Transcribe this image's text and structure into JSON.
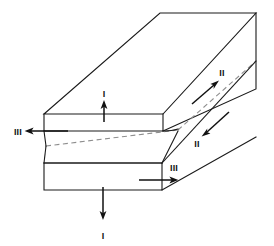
{
  "figure": {
    "name": "fracture-modes-diagram",
    "background_color": "#ffffff",
    "edge_color": "#1a1a1a",
    "crack_line_color": "#8e8e8e",
    "arrow_color": "#111111"
  },
  "labels": {
    "mode_i_top": "I",
    "mode_i_bottom": "I",
    "mode_ii_upper": "II",
    "mode_ii_lower": "II",
    "mode_iii_left": "III",
    "mode_iii_right": "III"
  },
  "geometry": {
    "upper_block": {
      "front_face": "44,114 163,114 163,131 44,131",
      "top_face": "44,114 160,13 256,13 163,114",
      "right_face": "163,114 256,13 256,89 163,131"
    },
    "lower_block": {
      "front_face": "44,163 162,163 162,190 44,190",
      "top_face": "44,163 160,62 256,62 162,163",
      "right_face": "162,163 256,62 256,138 162,190"
    },
    "crack_front_dash": "46,146 178,130",
    "crack_flank_left": "44,131 46,146",
    "crack_flank_lower": "46,146 44,163"
  },
  "arrows": {
    "mode_i_top": {
      "from": [
        104,
        122
      ],
      "to": [
        104,
        101
      ],
      "direction": "up"
    },
    "mode_i_bottom": {
      "from": [
        103,
        187
      ],
      "to": [
        103,
        219
      ],
      "direction": "down"
    },
    "mode_ii_upper": {
      "from": [
        193,
        103
      ],
      "to": [
        219,
        80
      ],
      "direction": "up-right"
    },
    "mode_ii_lower": {
      "from": [
        228,
        113
      ],
      "to": [
        202,
        136
      ],
      "direction": "down-left"
    },
    "mode_iii_left": {
      "from": [
        67,
        131
      ],
      "to": [
        25,
        131
      ],
      "direction": "left"
    },
    "mode_iii_right": {
      "from": [
        140,
        180
      ],
      "to": [
        178,
        180
      ],
      "direction": "right"
    }
  },
  "label_positions": {
    "mode_i_top": [
      104,
      97
    ],
    "mode_i_bottom": [
      103,
      236
    ],
    "mode_ii_upper": [
      222,
      75
    ],
    "mode_ii_lower": [
      197,
      146
    ],
    "mode_iii_left": [
      19,
      135
    ],
    "mode_iii_right": [
      175,
      170
    ]
  }
}
